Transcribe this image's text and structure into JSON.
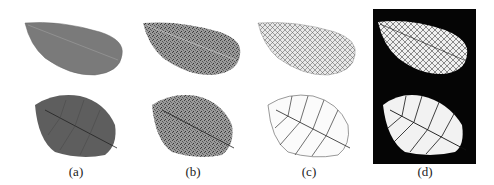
{
  "figure": {
    "panels": [
      {
        "id": "a",
        "caption": "(a)",
        "description": "Original grayscale leaf images"
      },
      {
        "id": "b",
        "caption": "(b)",
        "description": "Texture-enhanced leaf images"
      },
      {
        "id": "c",
        "caption": "(c)",
        "description": "Extracted vein images"
      },
      {
        "id": "d",
        "caption": "(d)",
        "description": "Binary inverted vein images on black background"
      }
    ],
    "colors": {
      "leaf_gray": "#7a7a7a",
      "leaf_dark": "#5e5e5e",
      "texture_gray": "#8e8e8e",
      "vein_dark": "#2a2a2a",
      "panel_d_bg": "#050505",
      "panel_d_leaf": "#f2f2f2"
    }
  }
}
